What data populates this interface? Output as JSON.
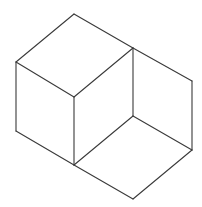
{
  "diagram": {
    "type": "line-drawing",
    "stroke_color": "#3a3a3a",
    "background": "#ffffff",
    "vertices": {
      "top": [
        74,
        14
      ],
      "left_top": [
        16,
        62
      ],
      "front_top": [
        74,
        97
      ],
      "mid_top": [
        133,
        48
      ],
      "right_top": [
        192,
        81
      ],
      "left_bottom": [
        16,
        131
      ],
      "front_bottom": [
        74,
        165
      ],
      "inner": [
        133,
        116
      ],
      "right_bottom": [
        192,
        150
      ],
      "bottom": [
        133,
        199
      ]
    },
    "edges": [
      [
        "top",
        "left_top"
      ],
      [
        "top",
        "mid_top"
      ],
      [
        "left_top",
        "front_top"
      ],
      [
        "front_top",
        "mid_top"
      ],
      [
        "mid_top",
        "right_top"
      ],
      [
        "left_top",
        "left_bottom"
      ],
      [
        "front_top",
        "front_bottom"
      ],
      [
        "mid_top",
        "inner"
      ],
      [
        "right_top",
        "right_bottom"
      ],
      [
        "left_bottom",
        "front_bottom"
      ],
      [
        "front_bottom",
        "inner"
      ],
      [
        "inner",
        "right_bottom"
      ],
      [
        "front_bottom",
        "bottom"
      ],
      [
        "right_bottom",
        "bottom"
      ]
    ]
  }
}
